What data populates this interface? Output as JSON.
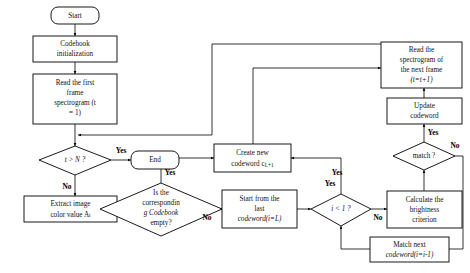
{
  "diagram": {
    "background_color": "#ffffff",
    "stroke_color": "#000000",
    "text_color": "#111111"
  },
  "nodes": {
    "start": {
      "label": "Start",
      "shape": "rounded-rectangle"
    },
    "init": {
      "line1": "Codebook",
      "line2": "initialization",
      "shape": "rectangle"
    },
    "read_first": {
      "line1": "Read the first",
      "line2": "frame",
      "line3": "spectrogram (t",
      "line4": "= 1)",
      "shape": "rectangle"
    },
    "t_gt_n": {
      "label": "t > N ?",
      "shape": "diamond"
    },
    "end": {
      "label": "End",
      "shape": "rounded-rectangle"
    },
    "extract": {
      "line1": "Extract image",
      "line2": "color value A",
      "sub2": "t",
      "shape": "rectangle"
    },
    "codebook_empty": {
      "line1": "Is the",
      "line2": "correspondin",
      "line3": "g Codebook",
      "line4": "empty?",
      "shape": "diamond"
    },
    "create_new": {
      "line1": "Create new",
      "line2": "codeword c",
      "sub2": "L+1",
      "shape": "rectangle"
    },
    "start_last": {
      "line1": "Start from the",
      "line2": "last",
      "line3": "codeword(i=L)",
      "shape": "rectangle"
    },
    "i_lt_1": {
      "label": "i < 1 ?",
      "shape": "diamond"
    },
    "calculate": {
      "line1": "Calculate the",
      "line2": "brightness",
      "line3": "criterion",
      "shape": "rectangle"
    },
    "match": {
      "label": "match ?",
      "shape": "diamond"
    },
    "match_next": {
      "line1": "Match next",
      "line2": "codeword(i=i-1)",
      "shape": "rectangle"
    },
    "update": {
      "line1": "Update",
      "line2": "codeword",
      "shape": "rectangle"
    },
    "read_next": {
      "line1": "Read the",
      "line2": "spectrogram of",
      "line3": "the next frame",
      "line4": "(t=t+1)",
      "shape": "rectangle"
    }
  },
  "edge_labels": {
    "t_gt_n_yes": "Yes",
    "t_gt_n_no": "No",
    "codebook_empty_yes": "Yes",
    "codebook_empty_no": "No",
    "i_lt_1_yes": "Yes",
    "i_lt_1_no": "No",
    "match_yes": "Yes",
    "match_no": "No",
    "create_new_yes": "Yes"
  }
}
